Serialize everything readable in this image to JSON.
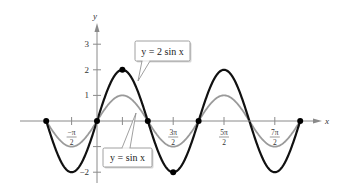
{
  "chart_data": {
    "type": "line",
    "title": "",
    "xlabel": "x",
    "ylabel": "y",
    "xlim_pi": [
      -1,
      4
    ],
    "ylim": [
      -2.3,
      3.6
    ],
    "x_ticks": [
      {
        "value_pi": -0.5,
        "num": "−π",
        "den": "2"
      },
      {
        "value_pi": 0.5,
        "num": "",
        "den": ""
      },
      {
        "value_pi": 1.5,
        "num": "3π",
        "den": "2"
      },
      {
        "value_pi": 2.5,
        "num": "5π",
        "den": "2"
      },
      {
        "value_pi": 3.5,
        "num": "7π",
        "den": "2"
      }
    ],
    "y_ticks": [
      {
        "value": 3,
        "label": "3"
      },
      {
        "value": 2,
        "label": "2"
      },
      {
        "value": 1,
        "label": "1"
      },
      {
        "value": -1,
        "label": ""
      },
      {
        "value": -2,
        "label": "−2"
      }
    ],
    "series": [
      {
        "name": "y = 2 sin x",
        "amplitude": 2,
        "color": "#111111",
        "width": 2.2
      },
      {
        "name": "y = sin x",
        "amplitude": 1,
        "color": "#9a9a9a",
        "width": 1.8
      }
    ],
    "marked_points": [
      {
        "x_pi": -1,
        "y": 0
      },
      {
        "x_pi": 0,
        "y": 0
      },
      {
        "x_pi": 0.5,
        "y": 2
      },
      {
        "x_pi": 1,
        "y": 0
      },
      {
        "x_pi": 1.5,
        "y": -2
      },
      {
        "x_pi": 2,
        "y": 0
      },
      {
        "x_pi": 4,
        "y": 0
      }
    ],
    "annotations": [
      {
        "text": "y = 2 sin x",
        "target": "y = 2 sin x"
      },
      {
        "text": "y = sin x",
        "target": "y = sin x"
      }
    ],
    "grid": false
  },
  "labels": {
    "x_axis": "x",
    "y_axis": "y",
    "callout_2sin": "y = 2 sin x",
    "callout_sin": "y = sin x"
  }
}
